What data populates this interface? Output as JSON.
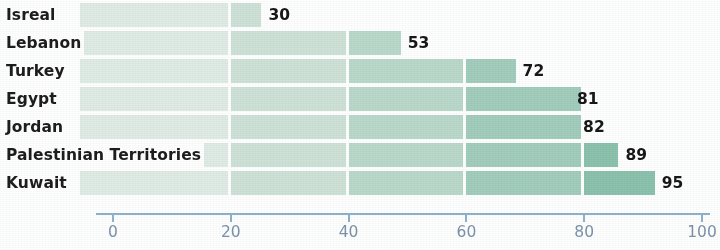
{
  "chart_data": {
    "type": "bar",
    "orientation": "horizontal",
    "title": "",
    "subtitle": "",
    "xlabel": "",
    "ylabel": "",
    "categories": [
      "Isreal",
      "Lebanon",
      "Turkey",
      "Egypt",
      "Jordan",
      "Palestinian Territories",
      "Kuwait"
    ],
    "values": [
      30,
      53,
      72,
      81,
      82,
      89,
      95
    ],
    "value_labels": [
      "30",
      "53",
      "72",
      "81",
      "82",
      "89",
      "95"
    ],
    "xlim": [
      0,
      100
    ],
    "xticks": [
      0,
      20,
      40,
      60,
      80,
      100
    ],
    "xtick_labels": [
      "0",
      "20",
      "40",
      "60",
      "80",
      "100"
    ],
    "grid": false,
    "legend": "none",
    "bar_segmentation_interval": 20,
    "segment_colors": [
      "#e0ece5",
      "#cfe2d8",
      "#bad9cb",
      "#a3cdbc",
      "#8cc2ae",
      "#74b5a4"
    ],
    "axis_color": "#8fb2cd",
    "tick_label_color": "#7d93ab",
    "category_label_color": "#1d1d1d",
    "value_label_color": "#171717",
    "background_color": "#ffffff"
  },
  "axis": {
    "ticks": [
      {
        "label": "0",
        "value": 0
      },
      {
        "label": "20",
        "value": 20
      },
      {
        "label": "40",
        "value": 40
      },
      {
        "label": "60",
        "value": 60
      },
      {
        "label": "80",
        "value": 80
      },
      {
        "label": "100",
        "value": 100
      }
    ]
  },
  "rows": [
    {
      "label": "Isreal",
      "value": 30,
      "value_label": "30"
    },
    {
      "label": "Lebanon",
      "value": 53,
      "value_label": "53"
    },
    {
      "label": "Turkey",
      "value": 72,
      "value_label": "72"
    },
    {
      "label": "Egypt",
      "value": 81,
      "value_label": "81"
    },
    {
      "label": "Jordan",
      "value": 82,
      "value_label": "82"
    },
    {
      "label": "Palestinian Territories",
      "value": 89,
      "value_label": "89"
    },
    {
      "label": "Kuwait",
      "value": 95,
      "value_label": "95"
    }
  ]
}
